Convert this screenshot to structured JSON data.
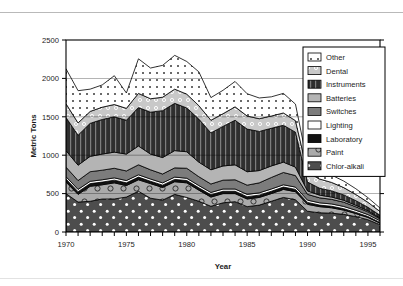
{
  "figure": {
    "background_color": "#ffffff",
    "frame_color": "#000000",
    "top_rule_color": "#b9b9b9"
  },
  "axes": {
    "x_title": "Year",
    "y_title": "Metric Tons",
    "x_ticklabels": [
      "1970",
      "1975",
      "1980",
      "1985",
      "1990",
      "1995"
    ],
    "y_ticklabels": [
      "0",
      "500",
      "1000",
      "1500",
      "2000",
      "2500"
    ]
  },
  "legend": {
    "position": "top-right",
    "border_color": "#000000",
    "background": "#ffffff",
    "entries": [
      {
        "label": "Other",
        "fill": "#ffffff",
        "pattern": "tiny-squares",
        "pattern_color": "#555555"
      },
      {
        "label": "Dental",
        "fill": "#c6c6c6",
        "pattern": "small-circles",
        "pattern_color": "#ffffff"
      },
      {
        "label": "Instruments",
        "fill": "#2e2e2e",
        "pattern": "dark-vertical",
        "pattern_color": "#8a8a8a"
      },
      {
        "label": "Batteries",
        "fill": "#b2b2b2",
        "pattern": "solid",
        "pattern_color": "#b2b2b2"
      },
      {
        "label": "Switches",
        "fill": "#7a7a7a",
        "pattern": "solid",
        "pattern_color": "#7a7a7a"
      },
      {
        "label": "Lighting",
        "fill": "#ffffff",
        "pattern": "solid",
        "pattern_color": "#ffffff"
      },
      {
        "label": "Laboratory",
        "fill": "#111111",
        "pattern": "solid",
        "pattern_color": "#111111"
      },
      {
        "label": "Paint",
        "fill": "#a8a8a8",
        "pattern": "open-circles",
        "pattern_color": "#3a3a3a"
      },
      {
        "label": "Chlor-alkali",
        "fill": "#4a4a4a",
        "pattern": "white-dots",
        "pattern_color": "#ffffff"
      }
    ]
  },
  "chart_data": {
    "type": "area",
    "stacked": true,
    "title": "",
    "xlabel": "Year",
    "ylabel": "Metric Tons",
    "xlim": [
      1970,
      1996
    ],
    "ylim": [
      0,
      2500
    ],
    "ytick_step": 500,
    "grid": false,
    "legend_position": "top-right",
    "x": [
      1970,
      1971,
      1972,
      1973,
      1974,
      1975,
      1976,
      1977,
      1978,
      1979,
      1980,
      1981,
      1982,
      1983,
      1984,
      1985,
      1986,
      1987,
      1988,
      1989,
      1990,
      1991,
      1992,
      1993,
      1994,
      1995,
      1996
    ],
    "series": [
      {
        "name": "Chlor-alkali",
        "values": [
          500,
          390,
          400,
          430,
          430,
          455,
          530,
          440,
          415,
          490,
          450,
          400,
          335,
          380,
          395,
          330,
          350,
          400,
          450,
          420,
          270,
          250,
          245,
          230,
          200,
          160,
          95
        ]
      },
      {
        "name": "Paint",
        "values": [
          150,
          100,
          195,
          185,
          210,
          150,
          150,
          190,
          165,
          165,
          190,
          145,
          120,
          120,
          105,
          100,
          100,
          100,
          105,
          105,
          90,
          80,
          70,
          55,
          40,
          30,
          20
        ]
      },
      {
        "name": "Laboratory",
        "values": [
          40,
          35,
          35,
          35,
          35,
          35,
          35,
          30,
          30,
          30,
          30,
          30,
          30,
          30,
          30,
          30,
          30,
          30,
          30,
          30,
          25,
          20,
          20,
          18,
          15,
          12,
          10
        ]
      },
      {
        "name": "Lighting",
        "values": [
          30,
          30,
          30,
          30,
          30,
          30,
          30,
          30,
          30,
          30,
          30,
          30,
          30,
          30,
          30,
          30,
          30,
          30,
          30,
          30,
          30,
          30,
          30,
          30,
          28,
          25,
          22
        ]
      },
      {
        "name": "Switches",
        "values": [
          125,
          115,
          125,
          125,
          125,
          125,
          130,
          120,
          115,
          120,
          130,
          115,
          110,
          115,
          120,
          120,
          130,
          150,
          160,
          150,
          75,
          65,
          60,
          55,
          45,
          35,
          25
        ]
      },
      {
        "name": "Batteries",
        "values": [
          215,
          200,
          200,
          210,
          210,
          220,
          245,
          205,
          215,
          225,
          215,
          190,
          185,
          185,
          195,
          175,
          160,
          150,
          135,
          110,
          45,
          35,
          30,
          25,
          20,
          15,
          10
        ]
      },
      {
        "name": "Instruments",
        "values": [
          430,
          390,
          430,
          450,
          460,
          440,
          500,
          545,
          610,
          615,
          570,
          560,
          480,
          515,
          580,
          555,
          510,
          490,
          480,
          455,
          115,
          90,
          80,
          70,
          60,
          45,
          35
        ]
      },
      {
        "name": "Dental",
        "values": [
          180,
          160,
          155,
          160,
          160,
          155,
          185,
          175,
          175,
          185,
          180,
          175,
          165,
          165,
          175,
          170,
          165,
          160,
          160,
          150,
          130,
          120,
          110,
          95,
          80,
          65,
          50
        ]
      },
      {
        "name": "Other",
        "values": [
          455,
          420,
          290,
          290,
          375,
          200,
          450,
          400,
          415,
          440,
          425,
          440,
          295,
          305,
          330,
          290,
          270,
          250,
          255,
          215,
          110,
          100,
          95,
          85,
          75,
          60,
          45
        ]
      }
    ]
  }
}
